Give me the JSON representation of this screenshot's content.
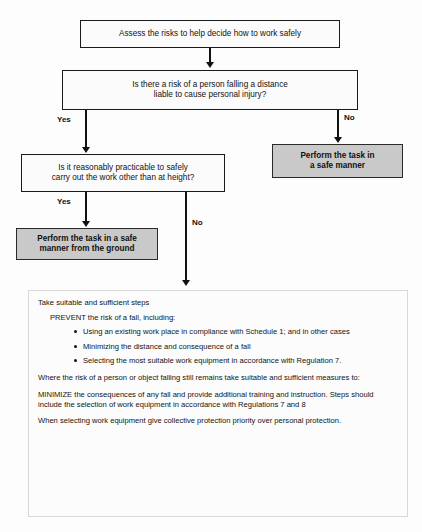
{
  "diagram": {
    "colors": {
      "fill_highlight": "#c9c9c9",
      "fill_plain": "#fbfbfb",
      "stroke": "#1a1a1a",
      "panel_border": "#d8d8d8"
    },
    "nodes": {
      "start": "Assess the risks to help decide how to work safely",
      "decision1": "Is there a risk of a person falling a distance\nliable to cause personal injury?",
      "decision2": "Is it reasonably practicable to safely\ncarry out the work other than at height?",
      "outcome_safe_manner": "Perform the task in\na safe manner",
      "outcome_from_ground": "Perform the task in a safe\nmanner from the ground"
    },
    "branch_labels": {
      "d1_yes": "Yes",
      "d1_no": "No",
      "d2_yes": "Yes",
      "d2_no": "No"
    }
  },
  "panel": {
    "lead": "Take suitable and sufficient steps",
    "sub": "PREVENT the risk of a fall, including:",
    "bullets": [
      "Using an existing work place in compliance with Schedule 1; and in other cases",
      "Minimizing the distance and consequence of a fall",
      "Selecting the most suitable work equipment in accordance with Regulation 7."
    ],
    "paragraphs": [
      "Where the risk of a person or object falling still remains take suitable and sufficient measures to:",
      "MINIMIZE the consequences of any fall and provide additional training and instruction. Steps should include the selection of work equipment in accordance with Regulations 7 and 8",
      "When selecting work equipment give collective protection priority over personal protection."
    ]
  }
}
